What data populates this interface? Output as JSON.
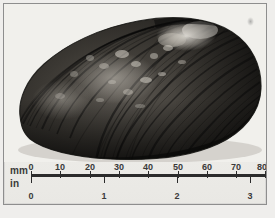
{
  "plate": {
    "kind": "photographic-plate",
    "subject": "freshwater mussel shell, right valve, exterior view",
    "background_color": "#efeeec",
    "frame_color": "#8e8e8e"
  },
  "specimen": {
    "name": "mussel-shell",
    "description": "dark elongate-ovate bivalve shell with concentric growth rings and pale eroded umbo region",
    "tones": {
      "darkest": "#1a1a1a",
      "mid": "#4a4a4a",
      "light": "#b9b6b0",
      "highlight": "#e6e3dd"
    },
    "measured_length_mm": 78
  },
  "scale": {
    "name": "dual-scale-ruler",
    "rows": [
      {
        "unit_label": "mm",
        "ticks": [
          "0",
          "10",
          "20",
          "30",
          "40",
          "50",
          "60",
          "70",
          "80"
        ],
        "min": 0,
        "max": 80
      },
      {
        "unit_label": "in",
        "ticks": [
          "0",
          "1",
          "2",
          "3"
        ],
        "min": 0,
        "max": 3
      }
    ],
    "line_color": "#2b2b2b"
  }
}
